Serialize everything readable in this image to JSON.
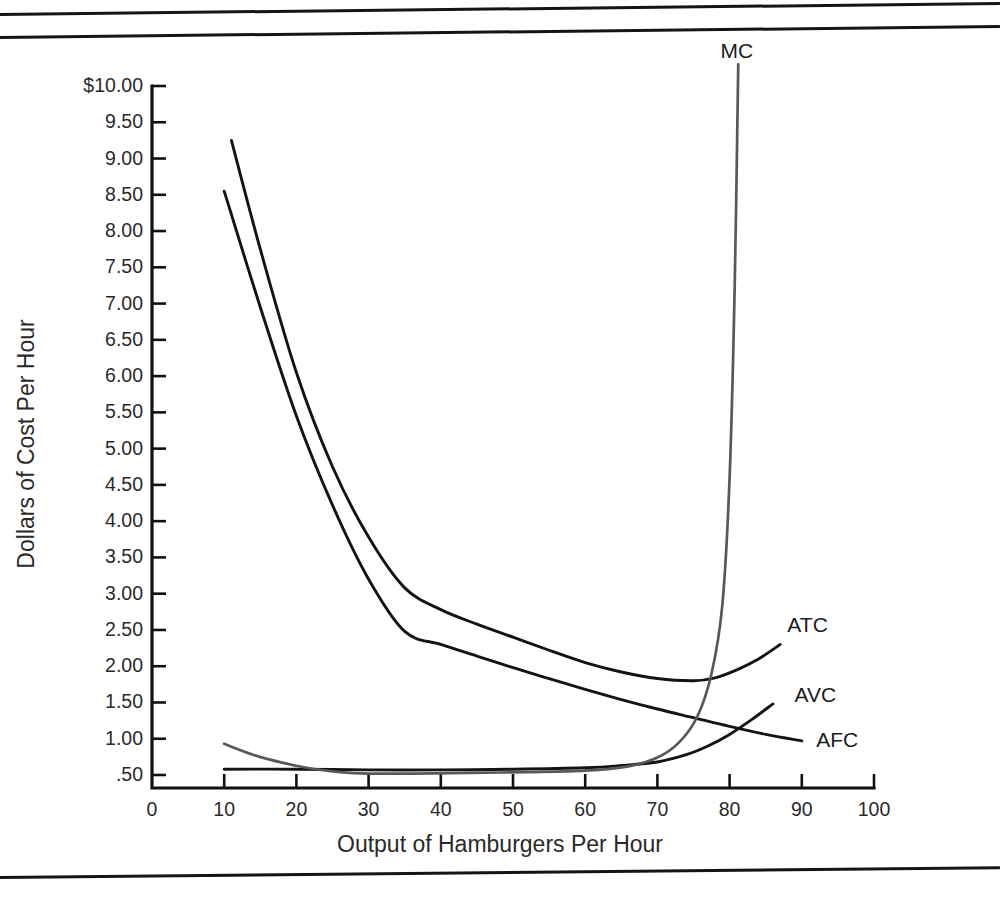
{
  "figure": {
    "background": "#ffffff",
    "rules": [
      "page-rule-top-1",
      "page-rule-top-2",
      "page-rule-bottom"
    ]
  },
  "chart_data": {
    "type": "line",
    "title": "",
    "xlabel": "Output of Hamburgers Per Hour",
    "ylabel": "Dollars of Cost Per Hour",
    "xlim": [
      0,
      100
    ],
    "ylim": [
      0,
      10
    ],
    "grid": false,
    "legend": "inline-curve-labels",
    "x_ticks": [
      0,
      10,
      20,
      30,
      40,
      50,
      60,
      70,
      80,
      90,
      100
    ],
    "x_tick_labels": [
      "0",
      "10",
      "20",
      "30",
      "40",
      "50",
      "60",
      "70",
      "80",
      "90",
      "100"
    ],
    "y_ticks": [
      0.5,
      1.0,
      1.5,
      2.0,
      2.5,
      3.0,
      3.5,
      4.0,
      4.5,
      5.0,
      5.5,
      6.0,
      6.5,
      7.0,
      7.5,
      8.0,
      8.5,
      9.0,
      9.5,
      10.0
    ],
    "y_tick_labels": [
      ".50",
      "1.00",
      "1.50",
      "2.00",
      "2.50",
      "3.00",
      "3.50",
      "4.00",
      "4.50",
      "5.00",
      "5.50",
      "6.00",
      "6.50",
      "7.00",
      "7.50",
      "8.00",
      "8.50",
      "9.00",
      "9.50",
      "$10.00"
    ],
    "series": [
      {
        "name": "ATC",
        "label": "ATC",
        "color": "#141414",
        "x": [
          11,
          15,
          20,
          25,
          30,
          35,
          40,
          45,
          50,
          55,
          60,
          65,
          70,
          75,
          78,
          81,
          84,
          87
        ],
        "y": [
          9.25,
          7.75,
          6.05,
          4.75,
          3.78,
          3.08,
          2.78,
          2.58,
          2.4,
          2.22,
          2.05,
          1.92,
          1.83,
          1.8,
          1.84,
          1.95,
          2.1,
          2.3
        ]
      },
      {
        "name": "AFC",
        "label": "AFC",
        "color": "#141414",
        "x": [
          10,
          15,
          20,
          25,
          30,
          35,
          40,
          45,
          50,
          55,
          60,
          65,
          70,
          75,
          80,
          85,
          90
        ],
        "y": [
          8.55,
          6.95,
          5.45,
          4.22,
          3.2,
          2.48,
          2.3,
          2.14,
          1.98,
          1.83,
          1.68,
          1.54,
          1.41,
          1.29,
          1.17,
          1.06,
          0.97
        ]
      },
      {
        "name": "AVC",
        "label": "AVC",
        "color": "#141414",
        "x": [
          10,
          20,
          30,
          40,
          50,
          60,
          65,
          70,
          74,
          77,
          80,
          83,
          86
        ],
        "y": [
          0.58,
          0.58,
          0.57,
          0.57,
          0.58,
          0.6,
          0.63,
          0.68,
          0.78,
          0.9,
          1.06,
          1.26,
          1.48
        ]
      },
      {
        "name": "MC",
        "label": "MC",
        "color": "#56585a",
        "x": [
          10,
          14,
          18,
          22,
          26,
          30,
          36,
          44,
          52,
          60,
          66,
          70,
          73,
          75.5,
          77.5,
          79,
          80,
          80.7,
          81.2
        ],
        "y": [
          0.93,
          0.78,
          0.67,
          0.59,
          0.54,
          0.52,
          0.52,
          0.53,
          0.54,
          0.56,
          0.62,
          0.74,
          0.95,
          1.3,
          1.9,
          2.85,
          4.6,
          7.2,
          10.3
        ]
      }
    ],
    "annotations": [
      {
        "text": "MC",
        "x": 81,
        "y": 10.35,
        "anchor": "label-above-curve"
      },
      {
        "text": "ATC",
        "x": 88,
        "y": 2.58,
        "anchor": "label-right-of-curve"
      },
      {
        "text": "AVC",
        "x": 89,
        "y": 1.62,
        "anchor": "label-right-of-curve"
      },
      {
        "text": "AFC",
        "x": 92,
        "y": 1.0,
        "anchor": "label-right-of-curve"
      }
    ]
  }
}
